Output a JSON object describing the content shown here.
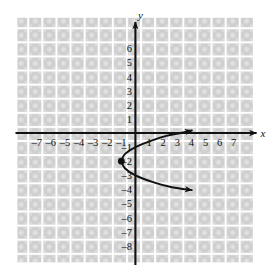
{
  "figure": {
    "kind": "coordinate-plane-graph",
    "background_color": "#ffffff",
    "grid_cell_color": "#cccccc",
    "grid_line_color": "#ffffff",
    "axis_color": "#111111",
    "curve_color": "#111111",
    "x_axis_label": "x",
    "y_axis_label": "y"
  },
  "chart_data": {
    "type": "line",
    "title": "",
    "xlabel": "x",
    "ylabel": "y",
    "xlim": [
      -7.5,
      7.5
    ],
    "ylim": [
      -8.5,
      6.5
    ],
    "grid": true,
    "legend": "none",
    "x_ticks": [
      -7,
      -6,
      -5,
      -4,
      -3,
      -2,
      -1,
      1,
      2,
      3,
      4,
      5,
      6,
      7
    ],
    "x_tick_labels": [
      "-7",
      "-6",
      "-5",
      "-4",
      "-3",
      "-2",
      "-1",
      "1",
      "2",
      "3",
      "4",
      "5",
      "6",
      "7"
    ],
    "y_ticks": [
      6,
      5,
      4,
      3,
      2,
      1,
      -1,
      -2,
      -3,
      -4,
      -5,
      -6,
      -7,
      -8
    ],
    "y_tick_labels": [
      "6",
      "5",
      "4",
      "3",
      "2",
      "1",
      "-1",
      "-2",
      "-3",
      "-4",
      "-5",
      "-6",
      "-7",
      "-8"
    ],
    "series": [
      {
        "name": "sideways-parabola",
        "description": "Rightward-opening parabola with vertex at (-1, -2); x = (y + 2)^2 - 1",
        "vertex": [
          -1,
          -2
        ],
        "marked_points": [
          {
            "x": -1,
            "y": -2,
            "style": "filled-dot",
            "label": ""
          }
        ],
        "upper_branch": [
          {
            "x": -1,
            "y": -2
          },
          {
            "x": -0.75,
            "y": -1.5
          },
          {
            "x": 0,
            "y": -1
          },
          {
            "x": 1.25,
            "y": -0.5
          },
          {
            "x": 2.2,
            "y": -0.2
          },
          {
            "x": 3.2,
            "y": 0
          },
          {
            "x": 4.0,
            "y": 0.18
          }
        ],
        "lower_branch": [
          {
            "x": -1,
            "y": -2
          },
          {
            "x": -0.75,
            "y": -2.5
          },
          {
            "x": 0,
            "y": -3
          },
          {
            "x": 1.3,
            "y": -3.5
          },
          {
            "x": 2.6,
            "y": -3.85
          },
          {
            "x": 4.0,
            "y": -4.05
          }
        ],
        "arrow_ends": [
          {
            "x": 4.0,
            "y": 0.18,
            "direction": "right-up"
          },
          {
            "x": 4.0,
            "y": -4.05,
            "direction": "right-down"
          }
        ]
      }
    ]
  }
}
